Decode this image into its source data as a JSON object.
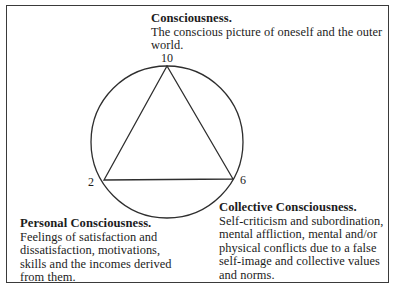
{
  "diagram": {
    "circle": {
      "cx": 167,
      "cy": 142,
      "r": 76,
      "stroke": "#2e2e2e"
    },
    "triangle": {
      "points": [
        [
          167,
          66
        ],
        [
          104,
          180
        ],
        [
          233,
          179
        ]
      ],
      "stroke": "#2e2e2e"
    },
    "vertex_labels": {
      "top": "10",
      "left": "2",
      "right": "6"
    }
  },
  "blocks": {
    "consciousness": {
      "title": "Consciousness.",
      "lines": [
        "The conscious picture of oneself and the outer",
        "world."
      ]
    },
    "personal": {
      "title": "Personal Consciousness.",
      "lines": [
        "Feelings of satisfaction and",
        "dissatisfaction, motivations,",
        "skills and the incomes derived",
        "from them."
      ]
    },
    "collective": {
      "title": "Collective Consciousness.",
      "lines": [
        "Self-criticism and subordination,",
        "mental affliction, mental and/or",
        "physical conflicts due to a false",
        "self-image and collective values",
        "and norms."
      ]
    }
  },
  "colors": {
    "background": "#ffffff",
    "line": "#2e2e2e",
    "text": "#1c1c1c",
    "frame": "#3a3a3a"
  }
}
